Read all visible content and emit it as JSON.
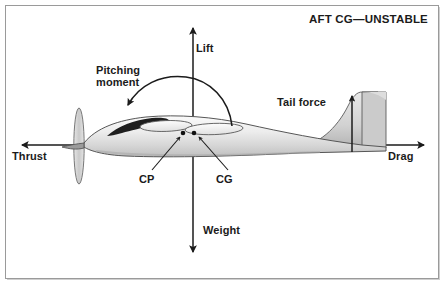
{
  "diagram": {
    "title": "AFT CG—UNSTABLE",
    "labels": {
      "lift": "Lift",
      "pitching_moment_line1": "Pitching",
      "pitching_moment_line2": "moment",
      "thrust": "Thrust",
      "drag": "Drag",
      "tail_force": "Tail force",
      "weight": "Weight",
      "cp": "CP",
      "cg": "CG"
    },
    "colors": {
      "ink": "#1b1b1b",
      "frame": "#9a9a9a",
      "frame_highlight": "#cfcfcf",
      "fuselage_light": "#f1f1f1",
      "fuselage_mid": "#d9d9d9",
      "fuselage_shadow": "#b6b6b6",
      "canopy_dark": "#1e1e1e",
      "outline": "#555555",
      "background": "#ffffff"
    },
    "force_vectors": [
      {
        "name": "lift",
        "direction": "up",
        "origin_x": 193,
        "label": "Lift"
      },
      {
        "name": "weight",
        "direction": "down",
        "origin_x": 193,
        "label": "Weight"
      },
      {
        "name": "thrust",
        "direction": "left",
        "origin_y": 145,
        "label": "Thrust"
      },
      {
        "name": "drag",
        "direction": "right",
        "origin_y": 145,
        "label": "Drag"
      },
      {
        "name": "tail-force",
        "direction": "up",
        "origin_x": 352,
        "label": "Tail force"
      },
      {
        "name": "pitching-moment",
        "direction": "counterclockwise-arc",
        "label": "Pitching moment"
      }
    ],
    "reference_points": [
      {
        "name": "CP",
        "label": "CP",
        "x": 183,
        "y": 133,
        "description": "center of pressure"
      },
      {
        "name": "CG",
        "label": "CG",
        "x": 194,
        "y": 133,
        "description": "center of gravity"
      }
    ],
    "icons": {
      "arrow_up": "arrow-up-icon",
      "arrow_down": "arrow-down-icon",
      "arrow_left": "arrow-left-icon",
      "arrow_right": "arrow-right-icon",
      "arc_arrow": "curved-arrow-icon",
      "aircraft": "aircraft-side-view-icon"
    }
  }
}
